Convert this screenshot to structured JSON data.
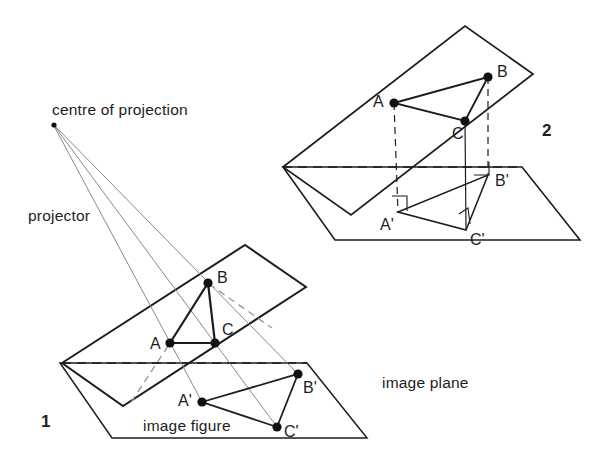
{
  "figure": {
    "stroke_color": "#1d1d1d",
    "thin_color": "#6e6e6e",
    "background": "#ffffff"
  },
  "labels": {
    "centre_of_projection": "centre of projection",
    "projector": "projector",
    "image_plane": "image plane",
    "image_figure": "image figure",
    "figure_one": "1",
    "figure_two": "2"
  },
  "label_positions": {
    "centre_of_projection": {
      "x": 52,
      "y": 108
    },
    "projector": {
      "x": 28,
      "y": 215
    },
    "image_plane": {
      "x": 382,
      "y": 382
    },
    "image_figure": {
      "x": 143,
      "y": 425
    },
    "figure_one": {
      "x": 41,
      "y": 413
    },
    "figure_two": {
      "x": 542,
      "y": 122
    }
  },
  "figure1": {
    "name": "central-projection",
    "centre_of_projection": {
      "x": 53,
      "y": 124
    },
    "object_plane_polygon": [
      {
        "x": 62,
        "y": 363
      },
      {
        "x": 245,
        "y": 245
      },
      {
        "x": 306,
        "y": 287
      },
      {
        "x": 123,
        "y": 406
      }
    ],
    "image_plane_polygon": [
      {
        "x": 60,
        "y": 363
      },
      {
        "x": 307,
        "y": 363
      },
      {
        "x": 367,
        "y": 438
      },
      {
        "x": 112,
        "y": 438
      }
    ],
    "object_points": {
      "A": {
        "x": 170,
        "y": 343,
        "label": "A",
        "label_x": 150,
        "label_y": 348
      },
      "B": {
        "x": 208,
        "y": 283,
        "label": "B",
        "label_x": 217,
        "label_y": 278
      },
      "C": {
        "x": 215,
        "y": 343,
        "label": "C",
        "label_x": 222,
        "label_y": 333
      }
    },
    "image_points": {
      "Ap": {
        "x": 202,
        "y": 402,
        "label": "A'",
        "label_x": 180,
        "label_y": 404
      },
      "Bp": {
        "x": 298,
        "y": 374,
        "label": "B'",
        "label_x": 303,
        "label_y": 391
      },
      "Cp": {
        "x": 277,
        "y": 427,
        "label": "C'",
        "label_x": 284,
        "label_y": 434
      }
    },
    "dashed_horizon": [
      {
        "x": 62,
        "y": 363
      },
      {
        "x": 307,
        "y": 363
      }
    ],
    "dashed_hidden_edge": [
      {
        "x": 208,
        "y": 283
      },
      {
        "x": 268,
        "y": 325
      }
    ],
    "dashed_hidden_edge2": [
      {
        "x": 168,
        "y": 345
      },
      {
        "x": 129,
        "y": 404
      }
    ]
  },
  "figure2": {
    "name": "orthographic-projection",
    "object_plane_polygon": [
      {
        "x": 283,
        "y": 167
      },
      {
        "x": 465,
        "y": 26
      },
      {
        "x": 533,
        "y": 74
      },
      {
        "x": 351,
        "y": 215
      }
    ],
    "image_plane_polygon": [
      {
        "x": 283,
        "y": 167
      },
      {
        "x": 522,
        "y": 167
      },
      {
        "x": 580,
        "y": 240
      },
      {
        "x": 335,
        "y": 240
      }
    ],
    "object_points": {
      "A": {
        "x": 394,
        "y": 103,
        "label": "A",
        "label_x": 374,
        "label_y": 102
      },
      "B": {
        "x": 488,
        "y": 77,
        "label": "B",
        "label_x": 497,
        "label_y": 72
      },
      "C": {
        "x": 465,
        "y": 121,
        "label": "C",
        "label_x": 455,
        "label_y": 138
      }
    },
    "image_points": {
      "Ap": {
        "x": 398,
        "y": 212,
        "label": "A'",
        "label_x": 383,
        "label_y": 228
      },
      "Bp": {
        "x": 488,
        "y": 175,
        "label": "B'",
        "label_x": 495,
        "label_y": 184
      },
      "Cp": {
        "x": 466,
        "y": 230,
        "label": "C'",
        "label_x": 472,
        "label_y": 243
      }
    },
    "projectors": [
      {
        "from": {
          "x": 394,
          "y": 103
        },
        "to": {
          "x": 398,
          "y": 212
        },
        "style": "dashed"
      },
      {
        "from": {
          "x": 488,
          "y": 77
        },
        "to": {
          "x": 488,
          "y": 175
        },
        "style": "dashed"
      },
      {
        "from": {
          "x": 465,
          "y": 121
        },
        "to": {
          "x": 466,
          "y": 230
        },
        "style": "solid"
      }
    ],
    "dashed_horizon": [
      {
        "x": 283,
        "y": 167
      },
      {
        "x": 522,
        "y": 167
      }
    ],
    "right_angle_marks": [
      {
        "at": "A'",
        "x": 398,
        "y": 212
      },
      {
        "at": "B'",
        "x": 488,
        "y": 175
      },
      {
        "at": "C'",
        "x": 466,
        "y": 230
      }
    ]
  }
}
